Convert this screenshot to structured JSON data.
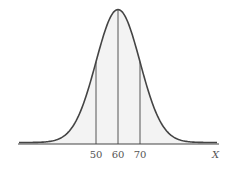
{
  "chart_data": {
    "type": "area",
    "title": "",
    "distribution": "normal",
    "mean": 60,
    "sd": 10,
    "xlabel": "X",
    "ylabel": "",
    "xticks": [
      50,
      60,
      70
    ],
    "tick_labels": [
      "50",
      "60",
      "70"
    ],
    "vertical_lines_at": [
      50,
      60,
      70
    ],
    "xlim": [
      15,
      105
    ],
    "grid": false,
    "legend": null,
    "colors": {
      "curve": "#444444",
      "fill": "#f3f3f3",
      "axis": "#444444",
      "text": "#555555"
    }
  }
}
